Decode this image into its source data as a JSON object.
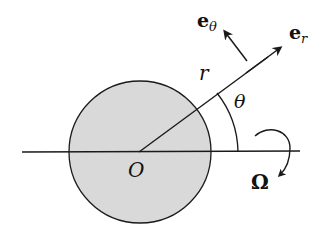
{
  "labels": {
    "e_theta_base": "e",
    "e_theta_sub": "θ",
    "e_r_base": "e",
    "e_r_sub": "r",
    "r": "r",
    "theta": "θ",
    "origin": "O",
    "omega": "Ω"
  },
  "colors": {
    "disk_fill": "#d9d9d9",
    "stroke": "#1a1a1a"
  }
}
